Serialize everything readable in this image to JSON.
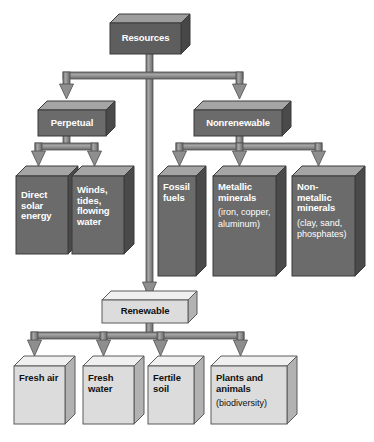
{
  "diagram": {
    "root": {
      "id": "resources",
      "label": "Resources"
    },
    "level1": [
      {
        "id": "perpetual",
        "label": "Perpetual"
      },
      {
        "id": "renewable",
        "label": "Renewable"
      },
      {
        "id": "nonrenewable",
        "label": "Nonrenewable"
      }
    ],
    "perpetual_children": [
      {
        "id": "direct-solar-energy",
        "label": "Direct solar energy"
      },
      {
        "id": "winds-tides-flowing-water",
        "label": "Winds, tides, flowing water"
      }
    ],
    "nonrenewable_children": [
      {
        "id": "fossil-fuels",
        "label": "Fossil fuels",
        "note": ""
      },
      {
        "id": "metallic-minerals",
        "label": "Metallic minerals",
        "note": "(iron, copper, aluminum)"
      },
      {
        "id": "non-metallic-minerals",
        "label": "Non-metallic minerals",
        "note": "(clay, sand, phosphates)"
      }
    ],
    "renewable_children": [
      {
        "id": "fresh-air",
        "label": "Fresh air",
        "note": ""
      },
      {
        "id": "fresh-water",
        "label": "Fresh water",
        "note": ""
      },
      {
        "id": "fertile-soil",
        "label": "Fertile soil",
        "note": ""
      },
      {
        "id": "plants-and-animals",
        "label": "Plants and animals",
        "note": "(biodiversity)"
      }
    ],
    "colors": {
      "background": "#ffffff",
      "dark_box_face": "#6d6d6d",
      "dark_box_top": "#9a9a9a",
      "dark_box_side": "#4a4a4a",
      "darkest_box_face": "#5a5a5a",
      "light_box_face": "#d9d9d9",
      "light_box_top": "#efefef",
      "light_box_side": "#b0b0b0",
      "connector": "#8a8a8a",
      "connector_edge": "#5c5c5c",
      "dark_text": "#111111",
      "light_text": "#ffffff"
    }
  }
}
